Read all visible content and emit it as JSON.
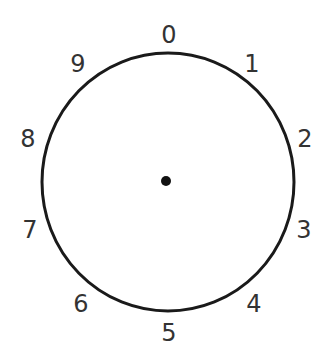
{
  "diagram": {
    "type": "dial",
    "center": {
      "x": 168,
      "y": 182
    },
    "radius_x": 126,
    "radius_y": 129,
    "stroke_color": "#1a1a1a",
    "label_color": "#333333",
    "center_dot": {
      "x": 166,
      "y": 181,
      "r": 5,
      "color": "#111111"
    },
    "labels": [
      {
        "text": "0",
        "x": 169,
        "y": 43
      },
      {
        "text": "1",
        "x": 252,
        "y": 72
      },
      {
        "text": "2",
        "x": 305,
        "y": 147
      },
      {
        "text": "3",
        "x": 304,
        "y": 238
      },
      {
        "text": "4",
        "x": 254,
        "y": 312
      },
      {
        "text": "5",
        "x": 169,
        "y": 341
      },
      {
        "text": "6",
        "x": 81,
        "y": 312
      },
      {
        "text": "7",
        "x": 30,
        "y": 238
      },
      {
        "text": "8",
        "x": 28,
        "y": 147
      },
      {
        "text": "9",
        "x": 78,
        "y": 72
      }
    ]
  }
}
